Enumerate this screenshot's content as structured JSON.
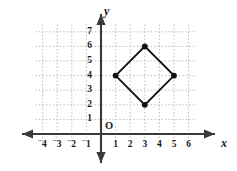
{
  "figure": {
    "kind": "coordinate-plane-graph",
    "origin_label": "O",
    "x_axis_name": "x",
    "y_axis_name": "y"
  },
  "axes": {
    "x_ticks": [
      "-4",
      "-3",
      "-2",
      "-1",
      "1",
      "2",
      "3",
      "4",
      "5",
      "6"
    ],
    "y_ticks": [
      "1",
      "2",
      "3",
      "4",
      "5",
      "6",
      "7"
    ],
    "x_range": [
      -4.6,
      6.6
    ],
    "y_range": [
      -0.7,
      7.6
    ],
    "grid": true,
    "grid_style": "dotted",
    "axis_color": "#3a3a3a",
    "grid_color": "#b9b9b9",
    "label_color": "#1a1a1a"
  },
  "chart_data": {
    "type": "scatter",
    "title": "",
    "xlabel": "x",
    "ylabel": "y",
    "xlim": [
      -4.6,
      6.6
    ],
    "ylim": [
      -0.7,
      7.6
    ],
    "grid": true,
    "legend": "none",
    "shape_name": "rhombus",
    "closed": true,
    "series": [
      {
        "name": "rhombus",
        "points": [
          {
            "x": 1,
            "y": 4
          },
          {
            "x": 3,
            "y": 6
          },
          {
            "x": 5,
            "y": 4
          },
          {
            "x": 3,
            "y": 2
          }
        ],
        "marker": "filled-circle",
        "marker_color": "#111111",
        "line_color": "#111111"
      }
    ]
  }
}
